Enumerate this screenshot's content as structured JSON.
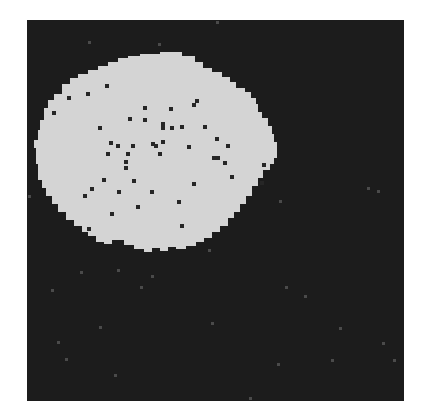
{
  "image": {
    "description": "Binary segmentation mask: a large irregular light-gray blob on a dark square background, with small dark holes inside the blob and faint gray speckles in the background",
    "colors": {
      "page_background": "#ffffff",
      "frame_background": "#1c1c1c",
      "blob": "#d4d4d4",
      "hole": "#262626",
      "speckle": "#4a4a4a"
    },
    "blob_polygon": [
      [
        175,
        52
      ],
      [
        182,
        52
      ],
      [
        182,
        56
      ],
      [
        195,
        56
      ],
      [
        195,
        62
      ],
      [
        203,
        62
      ],
      [
        203,
        68
      ],
      [
        212,
        68
      ],
      [
        212,
        72
      ],
      [
        222,
        72
      ],
      [
        222,
        77
      ],
      [
        230,
        77
      ],
      [
        230,
        82
      ],
      [
        236,
        82
      ],
      [
        236,
        88
      ],
      [
        245,
        88
      ],
      [
        245,
        92
      ],
      [
        251,
        92
      ],
      [
        251,
        98
      ],
      [
        256,
        98
      ],
      [
        256,
        104
      ],
      [
        258,
        104
      ],
      [
        258,
        112
      ],
      [
        262,
        112
      ],
      [
        262,
        118
      ],
      [
        268,
        118
      ],
      [
        268,
        126
      ],
      [
        272,
        126
      ],
      [
        272,
        134
      ],
      [
        274,
        134
      ],
      [
        274,
        142
      ],
      [
        277,
        142
      ],
      [
        277,
        158
      ],
      [
        274,
        158
      ],
      [
        274,
        164
      ],
      [
        270,
        164
      ],
      [
        270,
        170
      ],
      [
        263,
        170
      ],
      [
        263,
        178
      ],
      [
        258,
        178
      ],
      [
        258,
        186
      ],
      [
        252,
        186
      ],
      [
        252,
        196
      ],
      [
        246,
        196
      ],
      [
        246,
        204
      ],
      [
        240,
        204
      ],
      [
        240,
        212
      ],
      [
        234,
        212
      ],
      [
        234,
        218
      ],
      [
        228,
        218
      ],
      [
        228,
        226
      ],
      [
        220,
        226
      ],
      [
        220,
        232
      ],
      [
        212,
        232
      ],
      [
        212,
        238
      ],
      [
        204,
        238
      ],
      [
        204,
        242
      ],
      [
        196,
        242
      ],
      [
        196,
        246
      ],
      [
        186,
        246
      ],
      [
        186,
        249
      ],
      [
        176,
        249
      ],
      [
        176,
        247
      ],
      [
        168,
        247
      ],
      [
        168,
        251
      ],
      [
        160,
        251
      ],
      [
        160,
        248
      ],
      [
        152,
        248
      ],
      [
        152,
        252
      ],
      [
        144,
        252
      ],
      [
        144,
        249
      ],
      [
        134,
        249
      ],
      [
        134,
        245
      ],
      [
        124,
        245
      ],
      [
        124,
        240
      ],
      [
        112,
        240
      ],
      [
        112,
        244
      ],
      [
        104,
        244
      ],
      [
        104,
        242
      ],
      [
        96,
        242
      ],
      [
        96,
        236
      ],
      [
        88,
        236
      ],
      [
        88,
        232
      ],
      [
        82,
        232
      ],
      [
        82,
        226
      ],
      [
        74,
        226
      ],
      [
        74,
        220
      ],
      [
        66,
        220
      ],
      [
        66,
        212
      ],
      [
        58,
        212
      ],
      [
        58,
        204
      ],
      [
        52,
        204
      ],
      [
        52,
        196
      ],
      [
        46,
        196
      ],
      [
        46,
        188
      ],
      [
        42,
        188
      ],
      [
        42,
        180
      ],
      [
        38,
        180
      ],
      [
        38,
        164
      ],
      [
        36,
        164
      ],
      [
        36,
        148
      ],
      [
        34,
        148
      ],
      [
        34,
        140
      ],
      [
        38,
        140
      ],
      [
        38,
        130
      ],
      [
        40,
        130
      ],
      [
        40,
        120
      ],
      [
        44,
        120
      ],
      [
        44,
        108
      ],
      [
        48,
        108
      ],
      [
        48,
        100
      ],
      [
        54,
        100
      ],
      [
        54,
        94
      ],
      [
        62,
        94
      ],
      [
        62,
        84
      ],
      [
        70,
        84
      ],
      [
        70,
        78
      ],
      [
        78,
        78
      ],
      [
        78,
        74
      ],
      [
        88,
        74
      ],
      [
        88,
        70
      ],
      [
        98,
        70
      ],
      [
        98,
        66
      ],
      [
        108,
        66
      ],
      [
        108,
        62
      ],
      [
        118,
        62
      ],
      [
        118,
        58
      ],
      [
        128,
        58
      ],
      [
        128,
        56
      ],
      [
        140,
        56
      ],
      [
        140,
        54
      ],
      [
        160,
        54
      ],
      [
        160,
        52
      ]
    ],
    "holes": [
      [
        107,
        86
      ],
      [
        88,
        94
      ],
      [
        69,
        98
      ],
      [
        54,
        113
      ],
      [
        145,
        108
      ],
      [
        171,
        109
      ],
      [
        194,
        105
      ],
      [
        197,
        101
      ],
      [
        130,
        119
      ],
      [
        145,
        120
      ],
      [
        163,
        124
      ],
      [
        163,
        128
      ],
      [
        172,
        128
      ],
      [
        182,
        127
      ],
      [
        205,
        127
      ],
      [
        189,
        147
      ],
      [
        100,
        128
      ],
      [
        217,
        139
      ],
      [
        228,
        146
      ],
      [
        111,
        143
      ],
      [
        118,
        146
      ],
      [
        133,
        146
      ],
      [
        153,
        144
      ],
      [
        156,
        146
      ],
      [
        163,
        142
      ],
      [
        108,
        154
      ],
      [
        128,
        154
      ],
      [
        160,
        154
      ],
      [
        214,
        158
      ],
      [
        218,
        158
      ],
      [
        225,
        163
      ],
      [
        126,
        162
      ],
      [
        126,
        168
      ],
      [
        264,
        165
      ],
      [
        232,
        177
      ],
      [
        104,
        180
      ],
      [
        134,
        181
      ],
      [
        194,
        184
      ],
      [
        262,
        183
      ],
      [
        92,
        189
      ],
      [
        85,
        196
      ],
      [
        119,
        192
      ],
      [
        152,
        192
      ],
      [
        179,
        202
      ],
      [
        138,
        207
      ],
      [
        112,
        214
      ],
      [
        182,
        226
      ],
      [
        89,
        229
      ]
    ],
    "speckles": [
      [
        89,
        42
      ],
      [
        159,
        44
      ],
      [
        217,
        22
      ],
      [
        29,
        196
      ],
      [
        81,
        272
      ],
      [
        52,
        290
      ],
      [
        118,
        270
      ],
      [
        152,
        276
      ],
      [
        141,
        287
      ],
      [
        209,
        250
      ],
      [
        280,
        201
      ],
      [
        368,
        188
      ],
      [
        378,
        191
      ],
      [
        305,
        296
      ],
      [
        212,
        323
      ],
      [
        100,
        327
      ],
      [
        286,
        287
      ],
      [
        340,
        328
      ],
      [
        58,
        342
      ],
      [
        66,
        359
      ],
      [
        115,
        375
      ],
      [
        278,
        364
      ],
      [
        332,
        360
      ],
      [
        383,
        343
      ],
      [
        394,
        360
      ],
      [
        250,
        398
      ]
    ]
  }
}
